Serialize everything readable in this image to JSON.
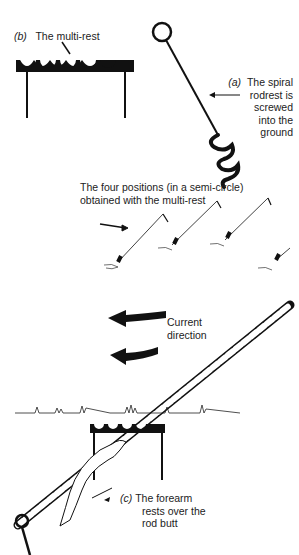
{
  "figure": {
    "panel_b": {
      "tag": "(b)",
      "title": "The multi-rest"
    },
    "panel_a": {
      "tag": "(a)",
      "lines": [
        "The spiral",
        "rodrest is",
        "screwed",
        "into the",
        "ground"
      ]
    },
    "positions_caption": [
      "The four positions (in a semi-circle)",
      "obtained with the multi-rest"
    ],
    "current_label": [
      "Current",
      "direction"
    ],
    "panel_c": {
      "tag": "(c)",
      "lines": [
        "The forearm",
        "rests over the",
        "rod butt"
      ]
    }
  },
  "colors": {
    "ink": "#111111",
    "background": "#ffffff"
  }
}
